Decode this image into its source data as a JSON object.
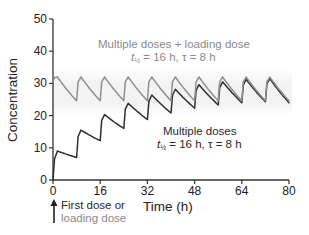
{
  "chart_data": {
    "type": "line",
    "title": "",
    "xlabel": "Time (h)",
    "ylabel": "Concentration",
    "xlim": [
      0,
      80
    ],
    "ylim": [
      0,
      50
    ],
    "xticks": [
      0,
      16,
      32,
      48,
      64,
      80
    ],
    "yticks": [
      0,
      10,
      20,
      30,
      40,
      50
    ],
    "grid": false,
    "shaded_band": {
      "y_from": 20,
      "y_to": 35,
      "x_from": 0,
      "x_to": 81,
      "color": "#f3f3f3"
    },
    "series": [
      {
        "name": "Multiple doses + loading dose",
        "color": "#8f8f8f",
        "params": {
          "t_half_h": 16,
          "tau_h": 8
        },
        "x": [
          0,
          0.5,
          1.5,
          8,
          8.5,
          9.5,
          16,
          16.5,
          17.5,
          24,
          24.5,
          25.5,
          32,
          32.5,
          33.5,
          40,
          40.5,
          41.5,
          48,
          48.5,
          49.5,
          56,
          56.5,
          57.5,
          64,
          64.5,
          65.5,
          72,
          72.5,
          73.5,
          80
        ],
        "y": [
          30.5,
          31.8,
          32.0,
          24.6,
          30.5,
          32.0,
          24.6,
          30.5,
          32.0,
          24.6,
          30.5,
          32.0,
          24.6,
          30.5,
          32.0,
          24.6,
          30.5,
          32.0,
          24.6,
          30.5,
          32.0,
          24.6,
          30.5,
          32.0,
          24.6,
          30.5,
          32.0,
          24.6,
          30.5,
          32.0,
          24.6
        ]
      },
      {
        "name": "Multiple doses",
        "color": "#2e2e2e",
        "params": {
          "t_half_h": 16,
          "tau_h": 8
        },
        "x": [
          0,
          0.5,
          1.5,
          8,
          8.5,
          9.5,
          16,
          16.5,
          17.5,
          24,
          24.5,
          25.5,
          32,
          32.5,
          33.5,
          40,
          40.5,
          41.5,
          48,
          48.5,
          49.5,
          56,
          56.5,
          57.5,
          64,
          64.5,
          65.5,
          72,
          72.5,
          73.5,
          80
        ],
        "y": [
          0,
          6.5,
          9.0,
          7.0,
          13.5,
          15.5,
          12.2,
          18.5,
          20.3,
          16.0,
          22.0,
          23.8,
          18.8,
          24.5,
          26.4,
          20.8,
          26.3,
          28.2,
          22.3,
          27.8,
          29.6,
          23.3,
          28.7,
          30.5,
          24.0,
          29.5,
          31.2,
          24.3,
          29.8,
          31.5,
          24.0
        ]
      }
    ],
    "annotations": [
      {
        "text": "Multiple doses + loading dose",
        "x": 37,
        "y": 41,
        "color": "#8a8a8a"
      },
      {
        "text": "t½ = 16 h, τ = 8 h",
        "x": 37,
        "y": 37.5,
        "color": "#8a8a8a"
      },
      {
        "text": "Multiple doses",
        "x": 55,
        "y": 15.5,
        "color": "#2a2a2a"
      },
      {
        "text": "t½ = 16 h, τ = 8 h",
        "x": 55,
        "y": 12,
        "color": "#2a2a2a"
      },
      {
        "text": "First dose or",
        "x": 2,
        "y": -7,
        "color": "#2a2a2a"
      },
      {
        "text": "loading dose",
        "x": 2,
        "y": -11,
        "color": "#8a8a8a"
      }
    ]
  },
  "labels": {
    "ylabel": "Concentration",
    "xlabel": "Time (h)",
    "ld_line1": "Multiple doses + loading dose",
    "ld_t": "t",
    "ld_sub": "½",
    "ld_rest": " = 16 h, τ = 8 h",
    "md_line1": "Multiple doses",
    "md_t": "t",
    "md_sub": "½",
    "md_rest": " = 16 h, τ = 8 h",
    "arrow_line1": "First dose or",
    "arrow_line2": "loading dose"
  }
}
